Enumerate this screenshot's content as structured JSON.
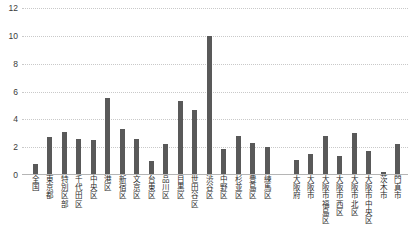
{
  "chart_data": {
    "type": "bar",
    "title": "",
    "xlabel": "",
    "ylabel": "",
    "ylim": [
      0,
      12
    ],
    "yticks": [
      0,
      2,
      4,
      6,
      8,
      10,
      12
    ],
    "grid": true,
    "legend": false,
    "bar_color": "#595959",
    "gridline_color": "#c9c9c9",
    "axis_color": "#b5b5b5",
    "categories": [
      "全国",
      "東京都",
      "特別区部",
      "千代田区",
      "中央区",
      "港区",
      "新宿区",
      "文京区",
      "台東区",
      "品川区",
      "目黒区",
      "世田谷区",
      "渋谷区",
      "中野区",
      "杉並区",
      "豊島区",
      "練馬区",
      "大阪府",
      "大阪市",
      "大阪市福島区",
      "大阪市西区",
      "大阪市北区",
      "大阪市中央区",
      "茨木市",
      "門真市"
    ],
    "values": [
      0.8,
      2.7,
      3.1,
      2.6,
      2.5,
      5.5,
      3.3,
      2.6,
      1.0,
      2.2,
      5.3,
      4.7,
      10.0,
      1.9,
      2.8,
      2.3,
      2.0,
      1.1,
      1.5,
      2.8,
      1.4,
      3.0,
      1.7,
      0.2,
      2.2
    ],
    "group_break_after_index": 16
  }
}
